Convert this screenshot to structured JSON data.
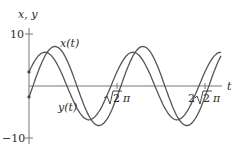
{
  "chart_data": {
    "type": "line",
    "title": "",
    "xlabel": "t",
    "ylabel": "x, y",
    "xlim": [
      0,
      9.7
    ],
    "ylim": [
      -10,
      10
    ],
    "grid": false,
    "y_ticks": [
      {
        "value": 10,
        "label": "10"
      },
      {
        "value": -10,
        "label": "−10"
      }
    ],
    "x_ticks": [
      {
        "value": 4.443,
        "label_pre": "",
        "label_rad": "2",
        "label_post": " π",
        "label": "√2 π"
      },
      {
        "value": 8.886,
        "label_pre": "2",
        "label_rad": "2",
        "label_post": " π",
        "label": "2√2 π"
      }
    ],
    "series": [
      {
        "name": "x(t)",
        "label": "x(t)",
        "color": "#555555",
        "model": {
          "amplitude": 7.6,
          "omega": 1.4142,
          "phase": -0.28
        },
        "x": [
          0,
          0.5,
          1.0,
          1.31,
          1.5,
          2.0,
          2.5,
          3.0,
          3.53,
          4.0,
          4.5,
          5.0,
          5.5,
          5.75,
          6.0,
          6.5,
          7.0,
          7.5,
          7.97,
          8.5,
          9.0,
          9.5
        ],
        "values": [
          -2.1,
          2.7,
          6.6,
          7.6,
          7.5,
          5.2,
          1.0,
          -3.6,
          -7.6,
          -7.2,
          -4.1,
          0.5,
          5.0,
          6.6,
          7.5,
          6.3,
          2.5,
          -2.2,
          -7.6,
          -5.4,
          -0.8,
          3.9
        ]
      },
      {
        "name": "y(t)",
        "label": "y(t)",
        "color": "#555555",
        "model": {
          "amplitude": 6.5,
          "omega": 1.4142,
          "phase": 0.43
        },
        "x": [
          0,
          0.5,
          0.81,
          1.0,
          1.5,
          2.0,
          2.5,
          3.03,
          3.5,
          4.0,
          4.5,
          5.0,
          5.25,
          5.5,
          6.0,
          6.5,
          7.0,
          7.47,
          8.0,
          8.5,
          9.0,
          9.5
        ],
        "values": [
          2.7,
          5.9,
          6.5,
          6.4,
          4.6,
          1.0,
          -2.9,
          -6.5,
          -5.7,
          -2.6,
          1.5,
          5.1,
          6.2,
          6.5,
          4.8,
          1.3,
          -2.5,
          -6.5,
          -5.8,
          -2.8,
          1.2,
          4.9
        ]
      }
    ]
  },
  "labels": {
    "y_axis": "x, y",
    "x_axis": "t",
    "y_tick_top": "10",
    "y_tick_bottom": "−10",
    "tick1_radicand": "2",
    "tick1_suffix": "π",
    "tick2_prefix": "2",
    "tick2_radicand": "2",
    "tick2_suffix": "π",
    "series_x": "x(t)",
    "series_y": "y(t)"
  }
}
